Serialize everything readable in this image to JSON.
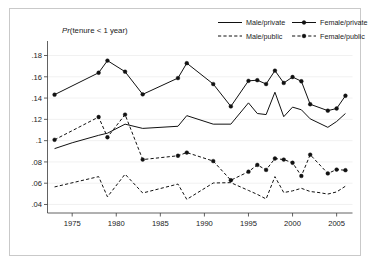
{
  "title": {
    "prefix": "Pr",
    "rest": "(tenure < 1 year)"
  },
  "legend": {
    "position": "top-right",
    "entries": [
      {
        "label": "Male/private",
        "style": "solid",
        "marker": false
      },
      {
        "label": "Female/private",
        "style": "solid",
        "marker": true
      },
      {
        "label": "Male/public",
        "style": "dashed",
        "marker": false
      },
      {
        "label": "Female/public",
        "style": "dashed",
        "marker": true
      }
    ]
  },
  "chart_data": {
    "type": "line",
    "title": "Pr(tenure < 1 year)",
    "xlabel": "",
    "ylabel": "",
    "xlim": [
      1972.2,
      2006.8
    ],
    "ylim": [
      0.032,
      0.188
    ],
    "grid": true,
    "xticks": [
      1975,
      1980,
      1985,
      1990,
      1995,
      2000,
      2005
    ],
    "xticklabels": [
      "1975",
      "1980",
      "1985",
      "1990",
      "1995",
      "2000",
      "2005"
    ],
    "yticks": [
      0.04,
      0.06,
      0.08,
      0.1,
      0.12,
      0.14,
      0.16,
      0.18
    ],
    "yticklabels": [
      ".04",
      ".06",
      ".08",
      ".1",
      ".12",
      ".14",
      ".16",
      ".18"
    ],
    "series": [
      {
        "name": "Male/private",
        "style": "solid",
        "marker": false,
        "x": [
          1973,
          1975,
          1978,
          1979,
          1981,
          1983,
          1987,
          1988,
          1991,
          1993,
          1995,
          1996,
          1997,
          1998,
          1999,
          2000,
          2001,
          2002,
          2004,
          2005,
          2006
        ],
        "values": [
          0.0925,
          0.098,
          0.105,
          0.107,
          0.1155,
          0.1115,
          0.1135,
          0.1235,
          0.1155,
          0.1155,
          0.1355,
          0.1255,
          0.1245,
          0.1455,
          0.1225,
          0.1315,
          0.129,
          0.1205,
          0.1125,
          0.118,
          0.1255
        ]
      },
      {
        "name": "Female/private",
        "style": "solid",
        "marker": true,
        "x": [
          1973,
          1978,
          1979,
          1981,
          1983,
          1987,
          1988,
          1991,
          1993,
          1995,
          1996,
          1997,
          1998,
          1999,
          2000,
          2001,
          2002,
          2004,
          2005,
          2006
        ],
        "values": [
          0.1432,
          0.1638,
          0.1752,
          0.1648,
          0.1435,
          0.1588,
          0.1728,
          0.1532,
          0.1322,
          0.1562,
          0.1568,
          0.1532,
          0.1658,
          0.1542,
          0.1598,
          0.1558,
          0.1342,
          0.1282,
          0.1302,
          0.1422
        ]
      },
      {
        "name": "Male/public",
        "style": "dashed",
        "marker": false,
        "x": [
          1973,
          1978,
          1979,
          1981,
          1983,
          1987,
          1988,
          1991,
          1993,
          1995,
          1996,
          1997,
          1998,
          1999,
          2000,
          2001,
          2002,
          2003,
          2004,
          2005,
          2006
        ],
        "values": [
          0.0565,
          0.0662,
          0.0472,
          0.0685,
          0.0508,
          0.0592,
          0.0448,
          0.0602,
          0.0605,
          0.0532,
          0.0495,
          0.0452,
          0.0662,
          0.0512,
          0.0528,
          0.0552,
          0.0522,
          0.0512,
          0.0498,
          0.0518,
          0.0572
        ]
      },
      {
        "name": "Female/public",
        "style": "dashed",
        "marker": true,
        "x": [
          1973,
          1978,
          1979,
          1981,
          1983,
          1987,
          1988,
          1991,
          1993,
          1995,
          1996,
          1997,
          1998,
          1999,
          2000,
          2001,
          2002,
          2004,
          2005,
          2006
        ],
        "values": [
          0.1008,
          0.1222,
          0.1032,
          0.1245,
          0.0822,
          0.0858,
          0.0888,
          0.0808,
          0.0628,
          0.0708,
          0.0772,
          0.0725,
          0.0832,
          0.0822,
          0.0792,
          0.0668,
          0.0868,
          0.0692,
          0.0728,
          0.0722
        ]
      }
    ]
  }
}
